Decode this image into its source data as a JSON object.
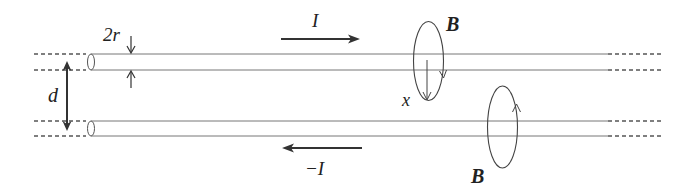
{
  "diagram": {
    "labels": {
      "radius": "2r",
      "separation": "d",
      "current_top": "I",
      "current_bottom": "−I",
      "field_top": "B",
      "field_bottom": "B",
      "distance": "x"
    },
    "colors": {
      "line": "#555555",
      "arrow": "#333333",
      "text": "#222222",
      "background": "#ffffff"
    }
  }
}
